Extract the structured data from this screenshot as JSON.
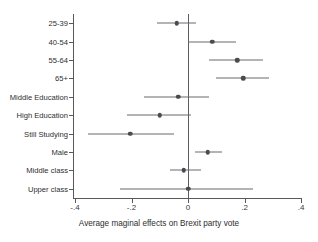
{
  "chart_data": {
    "type": "scatter",
    "title": "",
    "subtitle": "",
    "xlabel": "Average maginal effects on Brexit party vote",
    "ylabel": "",
    "xlim": [
      -0.4,
      0.4
    ],
    "xticks": [
      -0.4,
      -0.2,
      0,
      0.2,
      0.4
    ],
    "xticklabels": [
      "-.4",
      "-.2",
      "0",
      ".2",
      ".4"
    ],
    "grid": false,
    "legend": "none",
    "reference_line": 0,
    "categories": [
      "25-39",
      "40-54",
      "55-64",
      "65+",
      "Middle Education",
      "High Education",
      "Still Studying",
      "Male",
      "Middle class",
      "Upper class"
    ],
    "estimates": [
      -0.04,
      0.085,
      0.175,
      0.195,
      -0.035,
      -0.1,
      -0.205,
      0.07,
      -0.015,
      0.0
    ],
    "ci_low": [
      -0.11,
      0.0,
      0.075,
      0.1,
      -0.155,
      -0.215,
      -0.355,
      0.025,
      -0.065,
      -0.24
    ],
    "ci_high": [
      0.03,
      0.17,
      0.265,
      0.285,
      0.075,
      0.01,
      -0.05,
      0.12,
      0.045,
      0.23
    ],
    "points": [
      {
        "label": "25-39",
        "estimate": -0.04,
        "ci_low": -0.11,
        "ci_high": 0.03
      },
      {
        "label": "40-54",
        "estimate": 0.085,
        "ci_low": 0.0,
        "ci_high": 0.17
      },
      {
        "label": "55-64",
        "estimate": 0.175,
        "ci_low": 0.075,
        "ci_high": 0.265
      },
      {
        "label": "65+",
        "estimate": 0.195,
        "ci_low": 0.1,
        "ci_high": 0.285
      },
      {
        "label": "Middle Education",
        "estimate": -0.035,
        "ci_low": -0.155,
        "ci_high": 0.075
      },
      {
        "label": "High Education",
        "estimate": -0.1,
        "ci_low": -0.215,
        "ci_high": 0.01
      },
      {
        "label": "Still Studying",
        "estimate": -0.205,
        "ci_low": -0.355,
        "ci_high": -0.05
      },
      {
        "label": "Male",
        "estimate": 0.07,
        "ci_low": 0.025,
        "ci_high": 0.12
      },
      {
        "label": "Middle class",
        "estimate": -0.015,
        "ci_low": -0.065,
        "ci_high": 0.045
      },
      {
        "label": "Upper class",
        "estimate": 0.0,
        "ci_low": -0.24,
        "ci_high": 0.23
      }
    ],
    "colors": {
      "marker": "#4a4a4f",
      "ci": "#6b6b70",
      "axis": "#59595b",
      "reference_line": "#5d5d61",
      "background": "#ffffff",
      "text": "#2e2e30"
    }
  }
}
